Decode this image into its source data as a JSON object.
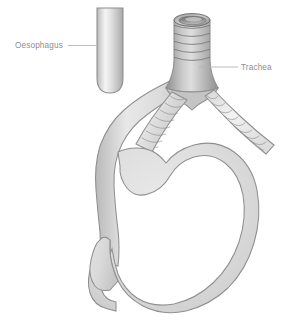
{
  "figure": {
    "background_color": "#ffffff",
    "width": 288,
    "height": 324
  },
  "labels": [
    {
      "id": "oesophagus",
      "text": "Oesophagus",
      "text_x": 15,
      "text_y": 48,
      "leader_x1": 68,
      "leader_y1": 45.5,
      "leader_x2": 98,
      "leader_y2": 45.5,
      "color": "#8d8d8d"
    },
    {
      "id": "trachea",
      "text": "Trachea",
      "text_x": 241,
      "text_y": 70,
      "leader_x1": 199,
      "leader_y1": 67,
      "leader_x2": 238,
      "leader_y2": 67,
      "color": "#8d8d8d"
    }
  ],
  "structures": [
    {
      "id": "oesophagus-stub",
      "name": "Oesophagus upper stub",
      "fill_light": "#f2f2f2",
      "fill_mid": "#d2d2d2",
      "fill_dark": "#ababab",
      "stroke": "#8f8f8f"
    },
    {
      "id": "trachea-tube",
      "name": "Trachea",
      "fill_light": "#e2e2e2",
      "fill_mid": "#b5b5b5",
      "fill_dark": "#8e8e8e",
      "stroke": "#6f6f6f",
      "cartilage_ring_count": 5
    },
    {
      "id": "left-main-bronchus",
      "name": "Left main bronchus",
      "fill_light": "#ededed",
      "fill_mid": "#c8c8c8",
      "stroke": "#7b7b7b",
      "cartilage_ring_count": 8
    },
    {
      "id": "right-main-bronchus",
      "name": "Right main bronchus",
      "fill_light": "#f4f4f4",
      "fill_mid": "#d8d8d8",
      "stroke": "#8a8a8a",
      "cartilage_ring_count": 9
    },
    {
      "id": "oesophagus-descending",
      "name": "Descending oesophagus",
      "fill_light": "#f0f0f0",
      "fill_mid": "#d0d0d0",
      "stroke": "#8f8f8f"
    },
    {
      "id": "stomach-body",
      "name": "Stomach",
      "fill_light": "#e6e6e6",
      "fill_mid": "#d6d6d6",
      "fill_dark": "#c2c2c2",
      "stroke": "#8f8f8f"
    },
    {
      "id": "duodenum",
      "name": "Duodenum",
      "fill_light": "#eaeaea",
      "fill_mid": "#d4d4d4",
      "stroke": "#8f8f8f"
    }
  ],
  "colors": {
    "outline": "#8f8f8f",
    "ring": "#777777",
    "label": "#8d8d8d",
    "leader": "#b4b4b4",
    "page_background": "#ffffff"
  }
}
